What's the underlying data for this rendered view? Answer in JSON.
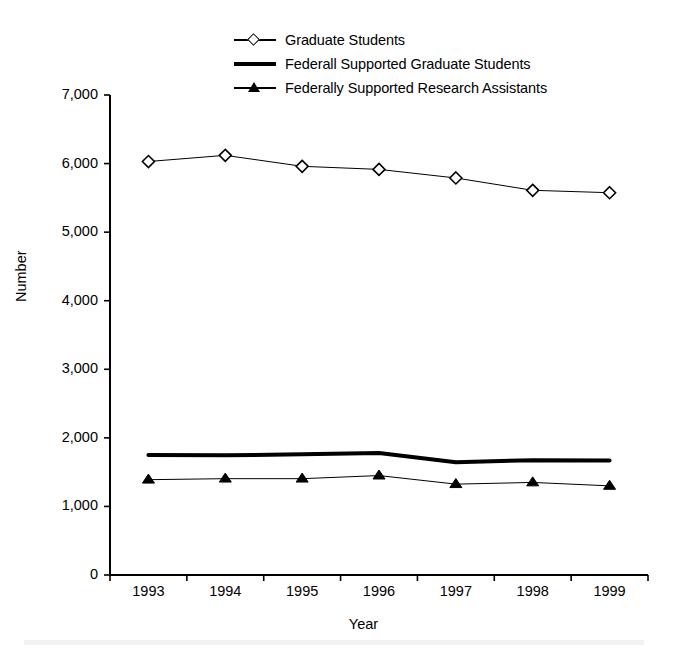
{
  "chart_data": {
    "type": "line",
    "title": "",
    "xlabel": "Year",
    "ylabel": "Number",
    "categories": [
      "1993",
      "1994",
      "1995",
      "1996",
      "1997",
      "1998",
      "1999"
    ],
    "x": [
      1993,
      1994,
      1995,
      1996,
      1997,
      1998,
      1999
    ],
    "ylim": [
      0,
      7000
    ],
    "xlim": [
      1993,
      1999
    ],
    "yticks": [
      0,
      1000,
      2000,
      3000,
      4000,
      5000,
      6000,
      7000
    ],
    "ytick_labels": [
      "0",
      "1,000",
      "2,000",
      "3,000",
      "4,000",
      "5,000",
      "6,000",
      "7,000"
    ],
    "grid": false,
    "legend_position": "top-center",
    "series": [
      {
        "name": "Graduate Students",
        "marker": "open-diamond",
        "line_width": 1,
        "color": "#000000",
        "values": [
          6030,
          6120,
          5960,
          5915,
          5790,
          5610,
          5575
        ]
      },
      {
        "name": "Federall Supported Graduate Students",
        "marker": "none",
        "line_width": 4,
        "color": "#000000",
        "values": [
          1750,
          1745,
          1760,
          1780,
          1645,
          1675,
          1670
        ]
      },
      {
        "name": "Federally Supported Research Assistants",
        "marker": "filled-triangle",
        "line_width": 1,
        "color": "#000000",
        "values": [
          1390,
          1405,
          1405,
          1450,
          1325,
          1350,
          1300
        ]
      }
    ]
  },
  "legend": {
    "entries": [
      {
        "label": "Graduate Students",
        "key": "line-open-diamond-key"
      },
      {
        "label": "Federall Supported Graduate Students",
        "key": "thick-line-key"
      },
      {
        "label": "Federally Supported Research Assistants",
        "key": "line-filled-triangle-key"
      }
    ]
  },
  "axes": {
    "y_title": "Number",
    "x_title": "Year"
  }
}
